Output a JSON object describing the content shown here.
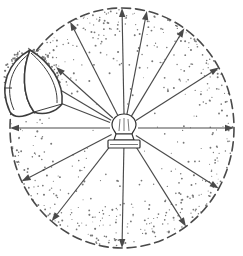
{
  "figure": {
    "title": "Light bulb radiating light with parabolic reflector",
    "caption": "",
    "type": "technical-line-drawing",
    "background_color": "#ffffff",
    "ink_color": "#3a3a3a",
    "stipple_color": "#777777"
  },
  "boundary": {
    "name": "dashed-radiation-circle",
    "shape": "circle",
    "center_x": 122,
    "center_y": 128,
    "radius_x": 112,
    "radius_y": 120,
    "style": "dashed",
    "dash_pattern": "9 5",
    "stroke_color": "#4a4a4a",
    "stroke_width": 1.6
  },
  "light_source": {
    "name": "incandescent-bulb",
    "label": "",
    "center_x": 124,
    "center_y": 128,
    "bulb_width": 20,
    "bulb_height": 22,
    "base_width": 30,
    "base_height": 9,
    "neck_width": 16
  },
  "reflector": {
    "name": "parabolic-reflector",
    "label": "",
    "position": "upper-left",
    "rim_top_x": 30,
    "rim_top_y": 50,
    "rim_bottom_x": 34,
    "rim_bottom_y": 112,
    "apex_x": 2,
    "apex_y": 84,
    "stroke_color": "#3c3c3c"
  },
  "rays": {
    "name": "light-rays",
    "count_free": 12,
    "count_to_reflector": 3,
    "stroke_color": "#4a4a4a",
    "arrowhead": "filled-triangle",
    "free_rays": [
      {
        "id": "ray-e",
        "angle_deg": 0,
        "label": "east"
      },
      {
        "id": "ray-ene",
        "angle_deg": 32,
        "label": "east-northeast"
      },
      {
        "id": "ray-ne",
        "angle_deg": 58,
        "label": "northeast"
      },
      {
        "id": "ray-nne",
        "angle_deg": 78,
        "label": "north-northeast"
      },
      {
        "id": "ray-n",
        "angle_deg": 90,
        "label": "north"
      },
      {
        "id": "ray-nnw",
        "angle_deg": 116,
        "label": "north-northwest"
      },
      {
        "id": "ray-w",
        "angle_deg": 180,
        "label": "west"
      },
      {
        "id": "ray-wsw",
        "angle_deg": 208,
        "label": "west-southwest"
      },
      {
        "id": "ray-sw",
        "angle_deg": 233,
        "label": "southwest"
      },
      {
        "id": "ray-s",
        "angle_deg": 270,
        "label": "south"
      },
      {
        "id": "ray-sse",
        "angle_deg": 303,
        "label": "south-southeast"
      },
      {
        "id": "ray-se",
        "angle_deg": 328,
        "label": "southeast"
      }
    ],
    "reflector_rays": [
      {
        "id": "ray-r1",
        "target_x": 56,
        "target_y": 67,
        "label": "ray-to-reflector-upper"
      },
      {
        "id": "ray-r2",
        "target_x": 40,
        "target_y": 78,
        "label": "ray-to-reflector-middle"
      },
      {
        "id": "ray-r3",
        "target_x": 32,
        "target_y": 92,
        "label": "ray-to-reflector-lower"
      }
    ]
  },
  "stipple": {
    "name": "shading-stipple",
    "description": "scattered dots, denser near circle rim and inside reflector",
    "dot_color": "#777777",
    "dot_radius": 0.75,
    "density": "graded-outward"
  }
}
